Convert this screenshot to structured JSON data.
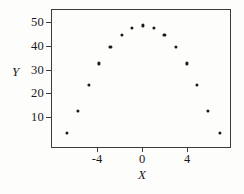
{
  "chart_data": {
    "type": "scatter",
    "title": "",
    "xlabel": "X",
    "ylabel": "Y",
    "xlim": [
      -7.8,
      7.6
    ],
    "ylim": [
      -1,
      56
    ],
    "grid": false,
    "legend": null,
    "xticks": [
      -4,
      0,
      4
    ],
    "xtick_labels": [
      "-4",
      "0",
      "4"
    ],
    "yticks": [
      10,
      20,
      30,
      40,
      50
    ],
    "ytick_labels": [
      "10",
      "20",
      "30",
      "40",
      "50"
    ],
    "marker": "filled-circle",
    "marker_color": "#1a1a1a",
    "points": [
      {
        "x": -6.8,
        "y": 3.7
      },
      {
        "x": -5.8,
        "y": 13
      },
      {
        "x": -4.8,
        "y": 24
      },
      {
        "x": -3.9,
        "y": 33
      },
      {
        "x": -2.9,
        "y": 40
      },
      {
        "x": -1.9,
        "y": 45
      },
      {
        "x": -1.0,
        "y": 48
      },
      {
        "x": 0.0,
        "y": 49
      },
      {
        "x": 1.0,
        "y": 48
      },
      {
        "x": 1.9,
        "y": 45
      },
      {
        "x": 2.9,
        "y": 40
      },
      {
        "x": 3.9,
        "y": 33
      },
      {
        "x": 4.8,
        "y": 24
      },
      {
        "x": 5.8,
        "y": 13
      },
      {
        "x": 6.8,
        "y": 3.8
      }
    ]
  },
  "axes": {
    "x_title": "X",
    "y_title": "Y"
  },
  "colors": {
    "axis": "#3b3b3b",
    "marker": "#1a1a1a",
    "background": "#fdfdfc"
  }
}
